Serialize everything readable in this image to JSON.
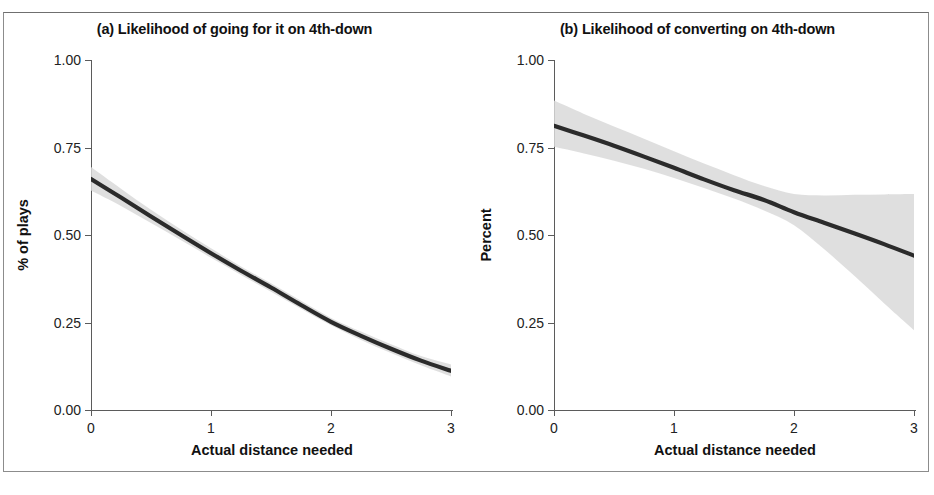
{
  "figure": {
    "background": "#ffffff",
    "frame_color": "#8c8c8c",
    "line_color": "#2b2b2b",
    "band_color": "#d9d9d9"
  },
  "panels": [
    {
      "key": "a",
      "title": "(a) Likelihood of going for it on 4th-down",
      "xlabel": "Actual distance needed",
      "ylabel": "% of plays"
    },
    {
      "key": "b",
      "title": "(b) Likelihood of converting on 4th-down",
      "xlabel": "Actual distance needed",
      "ylabel": "Percent"
    }
  ],
  "axis": {
    "yticks": [
      "1.00",
      "0.75",
      "0.50",
      "0.25",
      "0.00"
    ],
    "ytick_values": [
      1.0,
      0.75,
      0.5,
      0.25,
      0.0
    ],
    "xticks": [
      "0",
      "1",
      "2",
      "3"
    ],
    "xtick_values": [
      0,
      1,
      2,
      3
    ]
  },
  "chart_data": [
    {
      "type": "line",
      "panel": "a",
      "title": "(a) Likelihood of going for it on 4th-down",
      "xlabel": "Actual distance needed",
      "ylabel": "% of plays",
      "xlim": [
        0,
        3
      ],
      "ylim": [
        0,
        1
      ],
      "grid": false,
      "legend": "none",
      "x": [
        0,
        0.25,
        0.5,
        0.75,
        1,
        1.25,
        1.5,
        1.75,
        2,
        2.25,
        2.5,
        2.75,
        3
      ],
      "series": [
        {
          "name": "Predicted probability of going for it",
          "values": [
            0.66,
            0.607,
            0.553,
            0.5,
            0.448,
            0.398,
            0.35,
            0.3,
            0.252,
            0.212,
            0.175,
            0.141,
            0.112
          ]
        }
      ],
      "confidence_band": {
        "label": "95% confidence interval",
        "lower": [
          0.627,
          0.583,
          0.534,
          0.485,
          0.435,
          0.386,
          0.338,
          0.289,
          0.242,
          0.2,
          0.163,
          0.128,
          0.096
        ],
        "upper": [
          0.694,
          0.632,
          0.572,
          0.516,
          0.462,
          0.41,
          0.362,
          0.312,
          0.263,
          0.224,
          0.188,
          0.154,
          0.13
        ]
      }
    },
    {
      "type": "line",
      "panel": "b",
      "title": "(b) Likelihood of converting on 4th-down",
      "xlabel": "Actual distance needed",
      "ylabel": "Percent",
      "xlim": [
        0,
        3
      ],
      "ylim": [
        0,
        1
      ],
      "grid": false,
      "legend": "none",
      "x": [
        0,
        0.25,
        0.5,
        0.75,
        1,
        1.25,
        1.5,
        1.75,
        2,
        2.25,
        2.5,
        2.75,
        3
      ],
      "series": [
        {
          "name": "Predicted probability of converting",
          "values": [
            0.812,
            0.784,
            0.755,
            0.724,
            0.692,
            0.659,
            0.628,
            0.6,
            0.565,
            0.535,
            0.505,
            0.474,
            0.441
          ]
        }
      ],
      "confidence_band": {
        "label": "95% confidence interval",
        "lower": [
          0.752,
          0.733,
          0.712,
          0.689,
          0.663,
          0.634,
          0.604,
          0.57,
          0.528,
          0.46,
          0.384,
          0.305,
          0.228
        ],
        "upper": [
          0.884,
          0.846,
          0.81,
          0.775,
          0.739,
          0.704,
          0.671,
          0.64,
          0.617,
          0.613,
          0.615,
          0.616,
          0.617
        ]
      }
    }
  ]
}
